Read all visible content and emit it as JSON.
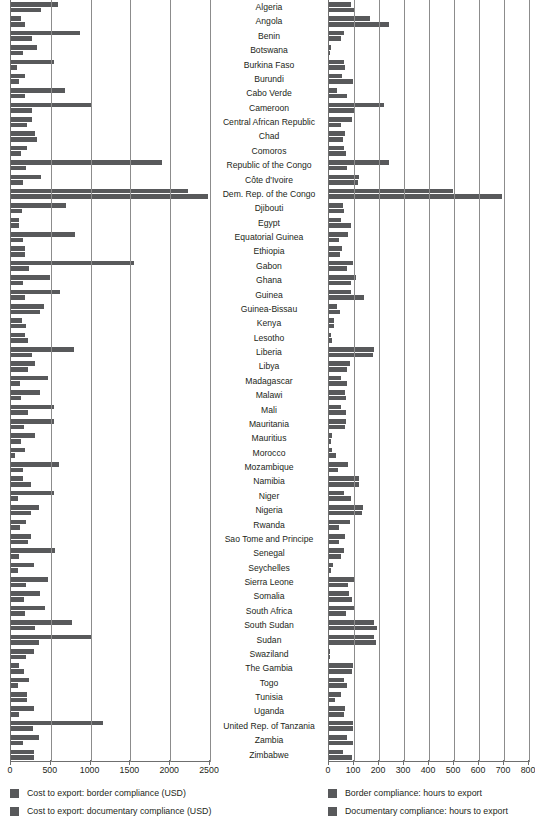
{
  "chart_data": {
    "type": "bar",
    "orientation": "horizontal",
    "title": "",
    "grid": true,
    "legend_position": "bottom",
    "panels": [
      {
        "id": "cost",
        "xlabel": "",
        "ylabel": "",
        "xlim": [
          0,
          2500
        ],
        "xticks": [
          0,
          500,
          1000,
          1500,
          2000,
          2500
        ],
        "xtick_labels": [
          "0",
          "500",
          "1000",
          "1500",
          "2000",
          "2500"
        ],
        "series": [
          {
            "name": "Cost to export: border compliance (USD)",
            "color": "#58595b"
          },
          {
            "name": "Cost to export: documentary compliance (USD)",
            "color": "#58595b"
          }
        ]
      },
      {
        "id": "hours",
        "xlabel": "",
        "ylabel": "",
        "xlim": [
          0,
          800
        ],
        "xticks": [
          0,
          100,
          200,
          300,
          400,
          500,
          600,
          700,
          800
        ],
        "xtick_labels": [
          "0",
          "100",
          "200",
          "300",
          "400",
          "500",
          "600",
          "700",
          "800"
        ],
        "series": [
          {
            "name": "Border compliance: hours to export",
            "color": "#58595b"
          },
          {
            "name": "Documentary compliance: hours to export",
            "color": "#58595b"
          }
        ]
      }
    ],
    "categories": [
      "Algeria",
      "Angola",
      "Benin",
      "Botswana",
      "Burkina Faso",
      "Burundi",
      "Cabo Verde",
      "Cameroon",
      "Central African Republic",
      "Chad",
      "Comoros",
      "Republic of the Congo",
      "Côte d'Ivoire",
      "Dem. Rep. of the Congo",
      "Djibouti",
      "Egypt",
      "Equatorial Guinea",
      "Ethiopia",
      "Gabon",
      "Ghana",
      "Guinea",
      "Guinea-Bissau",
      "Kenya",
      "Lesotho",
      "Liberia",
      "Libya",
      "Madagascar",
      "Malawi",
      "Mali",
      "Mauritania",
      "Mauritius",
      "Morocco",
      "Mozambique",
      "Namibia",
      "Niger",
      "Nigeria",
      "Rwanda",
      "Sao Tome and Principe",
      "Senegal",
      "Seychelles",
      "Sierra Leone",
      "Somalia",
      "South Africa",
      "South Sudan",
      "Sudan",
      "Swaziland",
      "The Gambia",
      "Togo",
      "Tunisia",
      "Uganda",
      "United Rep. of Tanzania",
      "Zambia",
      "Zimbabwe"
    ],
    "cost_border_usd": [
      593,
      130,
      873,
      330,
      535,
      170,
      680,
      1004,
      270,
      300,
      200,
      1895,
      373,
      2223,
      695,
      100,
      805,
      172,
      1545,
      490,
      620,
      420,
      143,
      170,
      795,
      300,
      468,
      370,
      545,
      545,
      303,
      178,
      601,
      145,
      543,
      354,
      183,
      250,
      547,
      283,
      465,
      360,
      428,
      763,
      1023,
      290,
      100,
      228,
      200,
      287,
      1160,
      350,
      285
    ],
    "cost_doc_usd": [
      374,
      175,
      260,
      150,
      78,
      103,
      175,
      267,
      200,
      330,
      127,
      190,
      155,
      2480,
      140,
      100,
      150,
      175,
      225,
      155,
      172,
      360,
      191,
      212,
      265,
      215,
      117,
      120,
      210,
      160,
      130,
      55,
      145,
      248,
      90,
      250,
      110,
      208,
      96,
      90,
      188,
      165,
      170,
      300,
      352,
      185,
      165,
      82,
      200,
      102,
      275,
      150,
      285
    ],
    "hours_border": [
      88,
      164,
      59,
      7,
      60,
      53,
      33,
      218,
      90,
      63,
      60,
      240,
      120,
      496,
      56,
      48,
      77,
      51,
      96,
      108,
      86,
      30,
      21,
      6,
      180,
      83,
      49,
      63,
      47,
      67,
      11,
      13,
      74,
      120,
      59,
      135,
      83,
      62,
      61,
      17,
      99,
      80,
      100,
      180,
      180,
      3,
      94,
      61,
      49,
      62,
      96,
      71,
      56
    ],
    "hours_doc": [
      100,
      240,
      48,
      4,
      64,
      96,
      71,
      98,
      48,
      54,
      67,
      72,
      114,
      690,
      60,
      88,
      40,
      44,
      71,
      89,
      139,
      44,
      19,
      12,
      174,
      72,
      73,
      66,
      68,
      62,
      9,
      26,
      36,
      120,
      87,
      131,
      38,
      40,
      47,
      7,
      75,
      90,
      68,
      192,
      186,
      5,
      91,
      70,
      24,
      59,
      96,
      96,
      91
    ]
  },
  "labels": {
    "left_ticks": [
      "0",
      "500",
      "1000",
      "1500",
      "2000",
      "2500"
    ],
    "right_ticks": [
      "0",
      "100",
      "200",
      "300",
      "400",
      "500",
      "600",
      "700",
      "800"
    ]
  },
  "legend": {
    "left": [
      "Cost to export: border compliance (USD)",
      "Cost to export: documentary compliance (USD)"
    ],
    "right": [
      "Border compliance: hours to export",
      "Documentary compliance: hours to export"
    ]
  }
}
